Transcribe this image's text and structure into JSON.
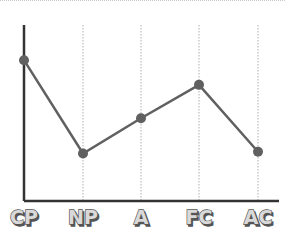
{
  "chart_data": {
    "type": "line",
    "title": "",
    "xlabel": "",
    "ylabel": "",
    "categories": [
      "CP",
      "NP",
      "A",
      "FC",
      "AC"
    ],
    "series": [
      {
        "name": "series",
        "values": [
          80,
          27,
          47,
          66,
          28
        ],
        "color": "#606060"
      }
    ],
    "ylim": [
      0,
      100
    ],
    "grid": {
      "vertical_dotted": true,
      "horizontal": false
    },
    "axis_color": "#333333",
    "grid_color": "#b0b0b0",
    "label_fill": "#d9d9d9",
    "label_outline": "#555555"
  }
}
